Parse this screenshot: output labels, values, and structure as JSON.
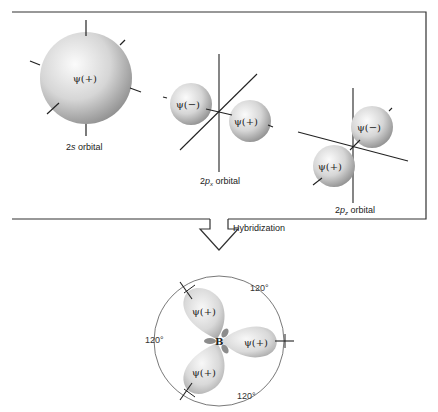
{
  "top_panel": {
    "orbitals": [
      {
        "name": "2s",
        "label_main": "2",
        "label_italic": "s",
        "label_suffix": " orbital",
        "lobes": [
          {
            "sign": "ψ(+)"
          }
        ]
      },
      {
        "name": "2px",
        "label_main": "2",
        "label_italic": "p",
        "label_sub": "x",
        "label_suffix": " orbital",
        "lobes": [
          {
            "sign": "ψ(−)"
          },
          {
            "sign": "ψ(+)"
          }
        ]
      },
      {
        "name": "2pz",
        "label_main": "2",
        "label_italic": "p",
        "label_sub": "z",
        "label_suffix": " orbital",
        "lobes": [
          {
            "sign": "ψ(−)"
          },
          {
            "sign": "ψ(+)"
          }
        ]
      }
    ]
  },
  "arrow": {
    "label": "Hybridization"
  },
  "hybrid": {
    "center_atom": "B",
    "lobes": [
      {
        "sign": "ψ(+)"
      },
      {
        "sign": "ψ(+)"
      },
      {
        "sign": "ψ(+)"
      }
    ],
    "angles": [
      "120°",
      "120°",
      "120°"
    ]
  },
  "colors": {
    "lobe_light": "#f4f4f4",
    "lobe_dark": "#9a9a9a",
    "line": "#222222"
  }
}
